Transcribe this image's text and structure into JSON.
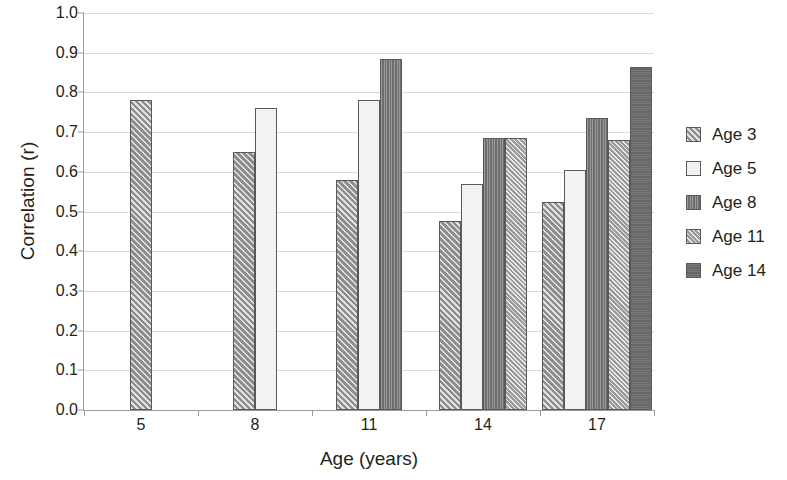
{
  "chart_data": {
    "type": "bar",
    "title": "",
    "xlabel": "Age (years)",
    "ylabel": "Correlation (r)",
    "categories": [
      "5",
      "8",
      "11",
      "14",
      "17"
    ],
    "ylim": [
      0.0,
      1.0
    ],
    "ytick_labels": [
      "0.0",
      "0.1",
      "0.2",
      "0.3",
      "0.4",
      "0.5",
      "0.6",
      "0.7",
      "0.8",
      "0.9",
      "1.0"
    ],
    "ytick_values": [
      0.0,
      0.1,
      0.2,
      0.3,
      0.4,
      0.5,
      0.6,
      0.7,
      0.8,
      0.9,
      1.0
    ],
    "grid": true,
    "legend_position": "right",
    "series": [
      {
        "name": "Age 3",
        "pattern": "diagonal-hatch-coarse",
        "color": "#8d8d8d",
        "values": [
          0.78,
          0.65,
          0.58,
          0.475,
          0.525
        ]
      },
      {
        "name": "Age 5",
        "pattern": "empty-white",
        "color": "#f2f2f0",
        "values": [
          null,
          0.76,
          0.78,
          0.57,
          0.605
        ]
      },
      {
        "name": "Age 8",
        "pattern": "dense-vertical-dark",
        "color": "#6e6e6e",
        "values": [
          null,
          null,
          0.885,
          0.685,
          0.735
        ]
      },
      {
        "name": "Age 11",
        "pattern": "diagonal-hatch-fine",
        "color": "#9a9a9a",
        "values": [
          null,
          null,
          null,
          0.685,
          0.68
        ]
      },
      {
        "name": "Age 14",
        "pattern": "solid-dark-gray",
        "color": "#666666",
        "values": [
          null,
          null,
          null,
          null,
          0.865
        ]
      }
    ]
  },
  "legend": {
    "items": [
      {
        "label": "Age 3"
      },
      {
        "label": "Age 5"
      },
      {
        "label": "Age 8"
      },
      {
        "label": "Age 11"
      },
      {
        "label": "Age 14"
      }
    ]
  },
  "axes": {
    "y_title": "Correlation (r)",
    "x_title": "Age (years)"
  }
}
